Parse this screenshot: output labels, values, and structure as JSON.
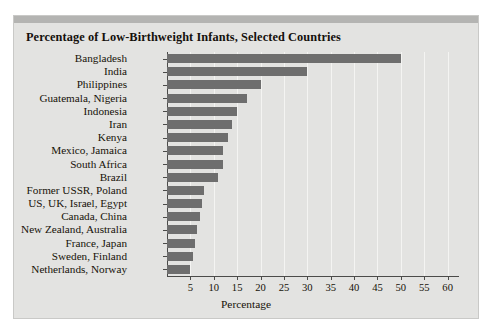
{
  "chart_data": {
    "type": "bar",
    "orientation": "horizontal",
    "title": "Percentage of Low-Birthweight Infants, Selected Countries",
    "xlabel": "Percentage",
    "ylabel": "",
    "xlim": [
      0,
      62
    ],
    "xticks": [
      5,
      10,
      15,
      20,
      25,
      30,
      35,
      40,
      45,
      50,
      55,
      60
    ],
    "grid": true,
    "legend": "none",
    "bar_color": "#6e6e6e",
    "panel_color": "#e3e3e1",
    "categories": [
      "Bangladesh",
      "India",
      "Philippines",
      "Guatemala, Nigeria",
      "Indonesia",
      "Iran",
      "Kenya",
      "Mexico, Jamaica",
      "South Africa",
      "Brazil",
      "Former USSR, Poland",
      "US, UK, Israel, Egypt",
      "Canada, China",
      "New Zealand, Australia",
      "France, Japan",
      "Sweden, Finland",
      "Netherlands, Norway"
    ],
    "values": [
      50,
      30,
      20,
      17,
      15,
      14,
      13,
      12,
      12,
      11,
      8,
      7.5,
      7,
      6.5,
      6,
      5.5,
      5
    ]
  }
}
